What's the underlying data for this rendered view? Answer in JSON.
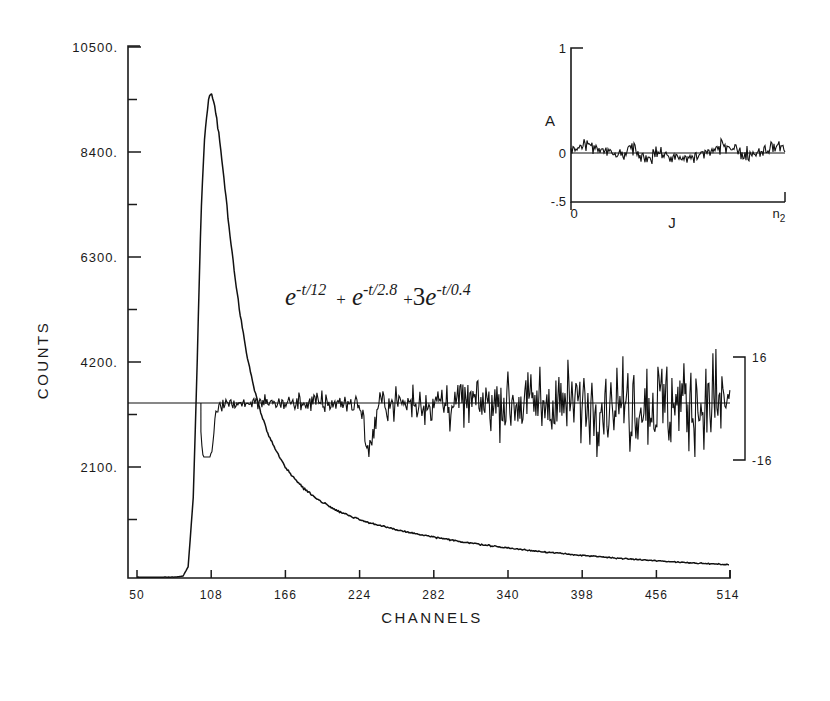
{
  "figure": {
    "title": "",
    "equation": {
      "term1_base": "e",
      "term1_exp": "-t/12",
      "plus1": "+",
      "term2_base": "e",
      "term2_exp": "-t/2.8",
      "plus2": "+",
      "coef3": "3",
      "term3_base": "e",
      "term3_exp": "-t/0.4"
    }
  },
  "main_axes": {
    "ylabel": "COUNTS",
    "xlabel": "CHANNELS",
    "ytick_labels": [
      "10500.",
      "8400.",
      "6300.",
      "4200.",
      "2100."
    ],
    "xtick_labels": [
      "50",
      "108",
      "166",
      "224",
      "282",
      "340",
      "398",
      "456",
      "514"
    ]
  },
  "residual_scale": {
    "top_label": "16",
    "bottom_label": "-16"
  },
  "inset": {
    "ylabel": "A",
    "xlabel": "J",
    "ytick_labels": [
      "1",
      "0",
      "-.5"
    ],
    "xtick_labels": [
      "0",
      "n2"
    ],
    "x_right_label_main": "n",
    "x_right_label_sub": "2"
  },
  "chart_data": {
    "type": "line",
    "title": "",
    "xlabel": "CHANNELS",
    "ylabel": "COUNTS",
    "xlim": [
      50,
      514
    ],
    "ylim": [
      0,
      11000
    ],
    "xticks": [
      50,
      108,
      166,
      224,
      282,
      340,
      398,
      456,
      514
    ],
    "yticks": [
      2100,
      4200,
      6300,
      8400,
      10500
    ],
    "grid": false,
    "legend": null,
    "annotation": "e^{-t/12} + e^{-t/2.8} + 3e^{-t/0.4}",
    "series": [
      {
        "name": "decay-data",
        "description": "Photon-counting decay curve: sharp rise near channel 95, peak ~9700 counts at channel 108, multi-exponential decay to ~250 counts at channel 514",
        "x": [
          50,
          60,
          70,
          80,
          86,
          90,
          94,
          97,
          100,
          103,
          106,
          108,
          111,
          114,
          118,
          122,
          126,
          130,
          136,
          142,
          148,
          154,
          160,
          166,
          174,
          182,
          190,
          198,
          206,
          214,
          224,
          234,
          244,
          254,
          264,
          274,
          284,
          294,
          304,
          314,
          324,
          334,
          344,
          354,
          364,
          374,
          384,
          394,
          404,
          414,
          424,
          434,
          444,
          454,
          464,
          474,
          484,
          494,
          504,
          514
        ],
        "y": [
          15,
          15,
          16,
          18,
          40,
          220,
          1600,
          4200,
          7200,
          8900,
          9550,
          9700,
          9450,
          8900,
          8000,
          7050,
          6150,
          5400,
          4450,
          3750,
          3200,
          2800,
          2480,
          2230,
          1960,
          1760,
          1600,
          1470,
          1360,
          1270,
          1170,
          1090,
          1020,
          960,
          905,
          855,
          810,
          765,
          725,
          690,
          655,
          620,
          590,
          560,
          535,
          510,
          485,
          462,
          440,
          420,
          400,
          382,
          365,
          348,
          333,
          318,
          304,
          290,
          277,
          265
        ]
      },
      {
        "name": "weighted-residuals",
        "description": "Weighted residuals trace drawn about a horizontal baseline at 3500 counts, scale bar spans +16 to -16",
        "baseline_counts": 3500,
        "scale_plus": 16,
        "scale_minus": -16,
        "x_start": 100,
        "x_end": 514
      }
    ],
    "inset_chart": {
      "type": "line",
      "name": "autocorrelation-inset",
      "xlabel": "J",
      "ylabel": "A",
      "xlim": [
        0,
        1
      ],
      "ylim": [
        -0.5,
        1.0
      ],
      "yticks": [
        -0.5,
        0,
        1
      ],
      "xtick_labels": [
        "0",
        "n2"
      ],
      "description": "Autocorrelation function of residuals fluctuating randomly about zero"
    }
  }
}
